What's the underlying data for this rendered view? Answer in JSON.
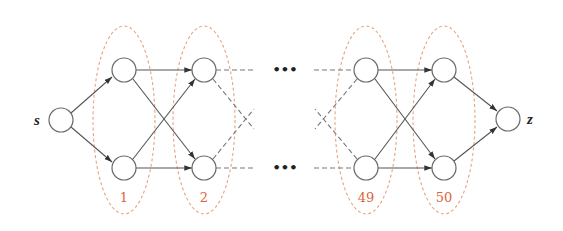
{
  "diagram": {
    "type": "layered directed graph",
    "source": {
      "label": "s"
    },
    "sink": {
      "label": "z"
    },
    "ellipsis": "•••",
    "groups": [
      {
        "label": "1"
      },
      {
        "label": "2"
      },
      {
        "label": "49"
      },
      {
        "label": "50"
      }
    ],
    "colors": {
      "group_outline": "#e8a47a",
      "group_label": "#d9653a",
      "node_stroke": "#6a6a6a",
      "edge": "#555555"
    }
  }
}
